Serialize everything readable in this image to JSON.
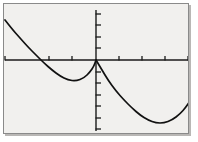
{
  "view": {
    "title": "graphing-calculator-plot",
    "background_color": "#f1f0ee",
    "frame_color": "#8a8a8a",
    "axis_color": "#1a1a1a",
    "curve_color": "#111111",
    "page_background": "#ffffff"
  },
  "chart_data": {
    "type": "line",
    "title": "",
    "xlabel": "",
    "ylabel": "",
    "grid": false,
    "legend": "none",
    "axes": {
      "x_axis_pixel_y": 56,
      "y_axis_pixel_x": 92,
      "x_tick_spacing_px": 23,
      "y_tick_spacing_px": 11.5,
      "x_tick_positions_px": [
        1,
        45,
        68,
        115,
        138,
        161,
        184
      ],
      "y_tick_positions_px": [
        10,
        21,
        33,
        44,
        68,
        79,
        91,
        102,
        114,
        125
      ],
      "xlim": [
        -4,
        4
      ],
      "ylim": [
        -5,
        2.5
      ]
    },
    "series": [
      {
        "name": "left-branch",
        "description": "upward-opening parabola arc, falls from upper-left, minimum below axis, rises to origin",
        "points_px": [
          [
            1,
            16
          ],
          [
            8,
            25
          ],
          [
            16,
            34
          ],
          [
            24,
            43
          ],
          [
            32,
            51
          ],
          [
            40,
            59
          ],
          [
            48,
            66
          ],
          [
            56,
            72
          ],
          [
            64,
            76
          ],
          [
            72,
            77
          ],
          [
            80,
            74
          ],
          [
            86,
            68
          ],
          [
            90,
            62
          ],
          [
            92,
            56
          ]
        ],
        "vertex_px": [
          70,
          77
        ],
        "x_intercepts_px": [
          27,
          92
        ]
      },
      {
        "name": "right-branch",
        "description": "upward-opening parabola arc, falls from origin, minimum low-right, rises toward right edge",
        "points_px": [
          [
            92,
            56
          ],
          [
            98,
            66
          ],
          [
            104,
            76
          ],
          [
            112,
            87
          ],
          [
            120,
            96
          ],
          [
            128,
            104
          ],
          [
            136,
            111
          ],
          [
            144,
            116
          ],
          [
            152,
            119
          ],
          [
            160,
            119
          ],
          [
            168,
            116
          ],
          [
            176,
            110
          ],
          [
            182,
            103
          ],
          [
            186,
            97
          ]
        ],
        "vertex_px": [
          156,
          119
        ],
        "x_intercepts_px": [
          92
        ]
      }
    ],
    "annotations": []
  }
}
